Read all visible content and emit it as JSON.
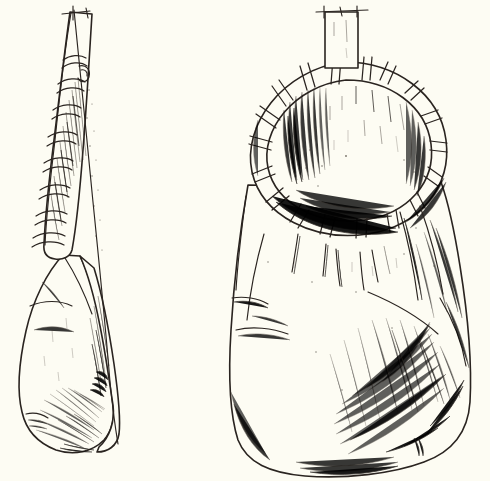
{
  "plate": {
    "background_color": "#fdfcf3",
    "ink_color": "#2a2420",
    "width": 490,
    "height": 481,
    "medium": "pen and ink line drawing",
    "subject": "hide bag with lashed rim hoop",
    "caption": ""
  },
  "figures": [
    {
      "id": "left-figure",
      "label": "side view",
      "name": "bag-side-view",
      "parts": [
        {
          "name": "pointed-tip",
          "label": "pointed tip"
        },
        {
          "name": "crossbar",
          "label": "crossbar at apex"
        },
        {
          "name": "binding-rings",
          "label": "binding rings",
          "count": 9
        },
        {
          "name": "tapered-neck",
          "label": "tapered neck"
        },
        {
          "name": "bag-body",
          "label": "bag body"
        },
        {
          "name": "seam-line",
          "label": "seam line"
        },
        {
          "name": "base-hatching",
          "label": "base hatching"
        }
      ]
    },
    {
      "id": "right-figure",
      "label": "front view",
      "name": "bag-front-view",
      "parts": [
        {
          "name": "top-strap-tab",
          "label": "top strap tab"
        },
        {
          "name": "rim-hoop",
          "label": "rim hoop"
        },
        {
          "name": "rim-lashings",
          "label": "rim lashings",
          "count": 22
        },
        {
          "name": "mouth-opening",
          "label": "mouth opening"
        },
        {
          "name": "hanging-thongs",
          "label": "hanging thongs",
          "count": 5
        },
        {
          "name": "bag-body",
          "label": "bag body"
        },
        {
          "name": "fold-creases",
          "label": "fold creases"
        },
        {
          "name": "crosshatch-texture",
          "label": "crosshatch texture"
        }
      ]
    }
  ]
}
